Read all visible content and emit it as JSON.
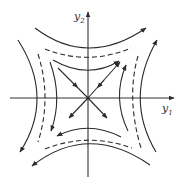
{
  "diagram": {
    "type": "phase-portrait",
    "axes": {
      "x_label": "y",
      "x_label_sub": "1",
      "y_label": "y",
      "y_label_sub": "2"
    },
    "colors": {
      "stroke": "#2b2b2b",
      "background": "#ffffff"
    },
    "trajectories": {
      "top": [
        "solid-outer",
        "dashed",
        "solid-inner"
      ],
      "bottom": [
        "solid-inner",
        "dashed",
        "solid-outer"
      ],
      "left": [
        "solid-outer",
        "dashed",
        "solid-inner"
      ],
      "right": [
        "solid-inner",
        "dashed",
        "solid-outer"
      ]
    },
    "separatrices": [
      {
        "direction": "NW",
        "flow": "toward-origin"
      },
      {
        "direction": "NE",
        "flow": "double-arrow"
      },
      {
        "direction": "SW",
        "flow": "away-from-origin"
      },
      {
        "direction": "SE",
        "flow": "away-from-origin"
      }
    ]
  }
}
